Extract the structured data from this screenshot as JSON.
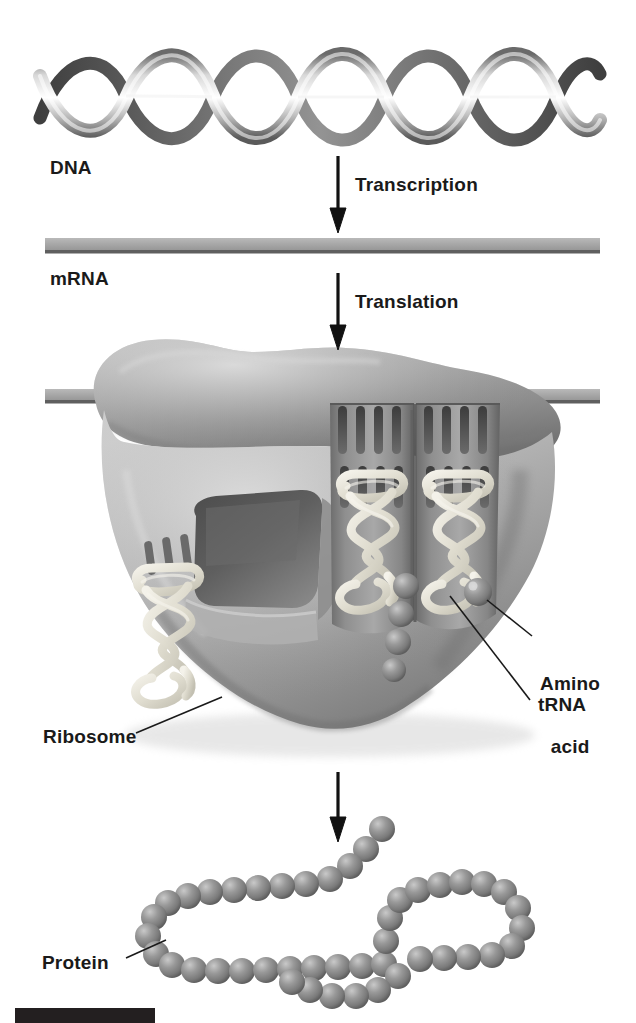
{
  "diagram": {
    "background_color": "#ffffff",
    "width": 636,
    "height": 1023
  },
  "labels": {
    "dna": "DNA",
    "mrna": "mRNA",
    "transcription": "Transcription",
    "translation": "Translation",
    "amino_acid_line1": "Amino",
    "amino_acid_line2": "acid",
    "trna": "tRNA",
    "ribosome": "Ribosome",
    "protein": "Protein"
  },
  "stages": [
    {
      "id": "dna",
      "label": "DNA",
      "element": "double-helix-ribbon"
    },
    {
      "id": "mrna",
      "label": "mRNA",
      "element": "single-strand-bar"
    },
    {
      "id": "ribosome",
      "label": "Ribosome",
      "element": "ribosome-body"
    },
    {
      "id": "protein",
      "label": "Protein",
      "element": "polypeptide-bead-chain"
    }
  ],
  "arrows": [
    {
      "id": "transcription-arrow",
      "label": "Transcription",
      "x": 338,
      "y_start": 156,
      "y_end": 233
    },
    {
      "id": "translation-arrow",
      "label": "Translation",
      "x": 338,
      "y_start": 273,
      "y_end": 350
    },
    {
      "id": "protein-arrow",
      "label": "",
      "x": 338,
      "y_start": 772,
      "y_end": 842
    }
  ],
  "leaders": [
    {
      "id": "amino-acid-leader",
      "label": "Amino acid",
      "from_x": 532,
      "from_y": 636,
      "to_x": 478,
      "to_y": 612
    },
    {
      "id": "trna-leader",
      "label": "tRNA",
      "from_x": 530,
      "from_y": 700,
      "to_x": 447,
      "to_y": 598
    },
    {
      "id": "ribosome-leader",
      "label": "Ribosome",
      "from_x": 136,
      "from_y": 733,
      "to_x": 216,
      "to_y": 698
    },
    {
      "id": "protein-leader",
      "label": "Protein",
      "from_x": 126,
      "from_y": 958,
      "to_x": 172,
      "to_y": 937
    }
  ],
  "colors": {
    "ink": "#1a1a1a",
    "page": "#ffffff",
    "helix_light": "#f2f2f2",
    "helix_mid": "#9a9a9a",
    "helix_dark": "#4a4a4a",
    "mrna_bar": "#a6a6a6",
    "mrna_edge": "#6e6e6e",
    "ribosome_large": "#a0a0a0",
    "ribosome_small": "#b4b4b4",
    "ribosome_shadow": "#6a6a6a",
    "channel_dark": "#5c5c5c",
    "trna_cream": "#e3e0d4",
    "bead_gray": "#8f8f8f",
    "black_bar": "#231f20"
  },
  "structures": {
    "dna": {
      "turns": 4,
      "strand_count": 2,
      "x_start": 40,
      "x_end": 600,
      "y_center": 100,
      "amplitude": 48
    },
    "mrna": {
      "x_start": 45,
      "x_end": 600,
      "y_top": 238,
      "thickness": 14
    },
    "ribosome": {
      "large_subunit": "upper lobe",
      "small_subunit": "lower body",
      "mrna_passes_through": true,
      "binding_site_count": 2
    },
    "trna_molecules": [
      {
        "id": "trna-exiting",
        "position": "left-outside",
        "occupied": false
      },
      {
        "id": "trna-site-p",
        "position": "center-channel",
        "occupied": true
      },
      {
        "id": "trna-site-a",
        "position": "right-channel",
        "occupied": true
      }
    ],
    "growing_chain": {
      "bead_count": 5,
      "orientation": "vertical"
    },
    "protein": {
      "bead_count": 54,
      "shape": "folded-looped-chain"
    }
  },
  "footer": {
    "black_bar_present": true
  }
}
